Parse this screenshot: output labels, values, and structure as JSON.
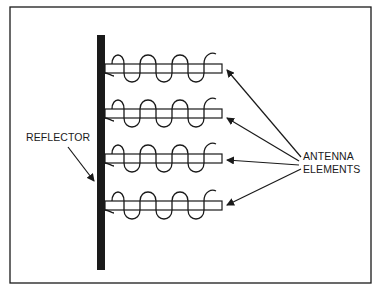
{
  "diagram": {
    "type": "helical antenna array schematic",
    "labels": {
      "reflector": "REFLECTOR",
      "antenna_elements_line1": "ANTENNA",
      "antenna_elements_line2": "ELEMENTS"
    },
    "components": {
      "reflector": {
        "count": 1,
        "orientation": "vertical"
      },
      "antenna_elements": {
        "count": 4,
        "orientation": "horizontal",
        "winding": "helical coil"
      }
    },
    "colors": {
      "ink": "#1a1a1a",
      "background": "#ffffff"
    }
  }
}
